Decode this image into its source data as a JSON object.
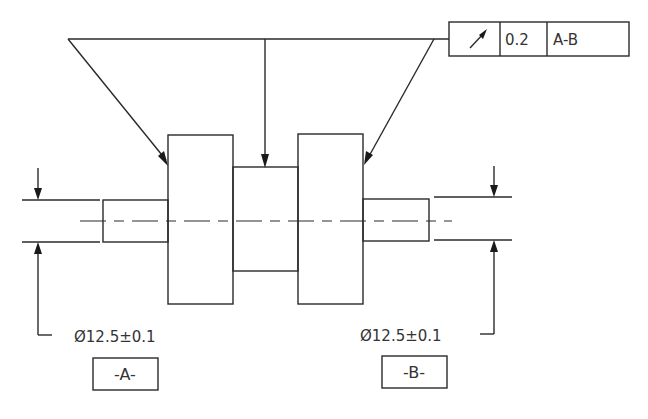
{
  "drawing": {
    "type": "engineering-drawing",
    "subject": "shaft with two datum journals and runout callout"
  },
  "feature_control_frame": {
    "symbol": "circular-runout",
    "tolerance": "0.2",
    "datum_reference": "A-B"
  },
  "dimensions": {
    "left": {
      "text": "Ø12.5±0.1"
    },
    "right": {
      "text": "Ø12.5±0.1"
    }
  },
  "datums": {
    "left": {
      "label": "-A-"
    },
    "right": {
      "label": "-B-"
    }
  },
  "colors": {
    "line": "#2a2a2a",
    "text": "#333333",
    "background": "#ffffff"
  }
}
